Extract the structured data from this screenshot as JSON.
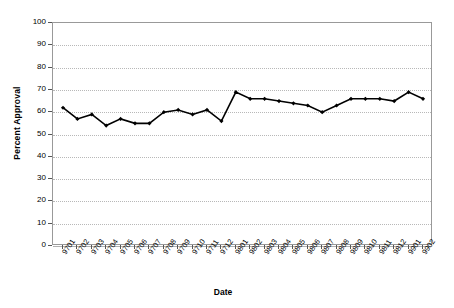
{
  "chart_data": {
    "type": "line",
    "title": "",
    "xlabel": "Date",
    "ylabel": "Percent Approval",
    "ylim": [
      0,
      100
    ],
    "ytick_step": 10,
    "yticks": [
      100,
      90,
      80,
      70,
      60,
      50,
      40,
      30,
      20,
      10,
      0
    ],
    "grid": true,
    "legend": "none",
    "marker": "diamond",
    "line_color": "#000000",
    "marker_color": "#000000",
    "categories": [
      "9701",
      "9702",
      "9703",
      "9704",
      "9705",
      "9706",
      "9707",
      "9708",
      "9709",
      "9710",
      "9711",
      "9712",
      "9801",
      "9802",
      "9803",
      "9804",
      "9805",
      "9806",
      "9807",
      "9808",
      "9809",
      "9810",
      "9811",
      "9812",
      "9901",
      "9902"
    ],
    "values": [
      62,
      57,
      59,
      54,
      57,
      55,
      55,
      60,
      61,
      59,
      61,
      56,
      69,
      66,
      66,
      65,
      64,
      63,
      60,
      63,
      66,
      66,
      66,
      65,
      69,
      66
    ]
  },
  "axis": {
    "y_title": "Percent Approval",
    "x_title": "Date"
  }
}
